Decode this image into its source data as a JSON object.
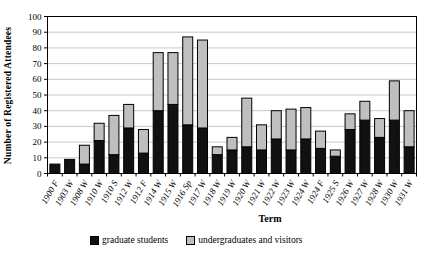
{
  "chart_data": {
    "type": "bar",
    "stacked": true,
    "title": "",
    "xlabel": "Term",
    "ylabel": "Number of Registered Attendees",
    "categories": [
      "1900 F",
      "1903 W",
      "1908 W",
      "1910 W",
      "1910 S",
      "1912 W",
      "1912 F",
      "1914 W",
      "1915 W",
      "1916 Sp",
      "1917 W",
      "1918 W",
      "1919 W",
      "1920 W",
      "1921 W",
      "1922 W",
      "1923 W",
      "1924 W",
      "1924 F",
      "1925 S",
      "1926 W",
      "1927 W",
      "1928 W",
      "1930 W",
      "1931 W"
    ],
    "series": [
      {
        "name": "graduate students",
        "color": "#111111",
        "values": [
          6,
          9,
          6,
          21,
          12,
          29,
          13,
          40,
          44,
          31,
          29,
          12,
          15,
          17,
          15,
          22,
          15,
          22,
          16,
          11,
          28,
          34,
          23,
          34,
          17
        ]
      },
      {
        "name": "undergraduates and visitors",
        "color": "#bfbfbf",
        "values": [
          0,
          0,
          12,
          11,
          25,
          15,
          15,
          37,
          33,
          56,
          56,
          5,
          8,
          31,
          16,
          18,
          26,
          20,
          11,
          4,
          10,
          12,
          12,
          25,
          23
        ]
      }
    ],
    "ylim": [
      0,
      100
    ],
    "ytick_step": 10,
    "grid": true,
    "legend_position": "bottom"
  },
  "colors": {
    "background": "#ffffff",
    "plot_border": "#000000",
    "gridline": "#c9c9c9",
    "text": "#000000"
  }
}
